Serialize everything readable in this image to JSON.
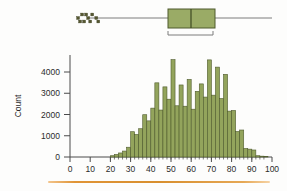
{
  "figure": {
    "background_color": "#fdfdfc",
    "bar_fill_color": "#93a45c",
    "bar_edge_color": "#4e5a2c",
    "axis_color": "#4a4a4a",
    "rule_color": "#e8a councils"
  },
  "boxplot": {
    "name": "horizontal-boxplot",
    "axis_min": 0,
    "axis_max": 100,
    "whisker_low": 20,
    "q1": 49,
    "median": 61,
    "q3": 72,
    "whisker_high": 100,
    "outliers": [
      4,
      5,
      6,
      7,
      8,
      9,
      10,
      11,
      13,
      14
    ],
    "bracket_from": 49,
    "bracket_to": 71,
    "box_fill_color": "#9aab66",
    "box_edge_color": "#4e5a2c",
    "line_color": "#6f6f6f"
  },
  "chart_data": {
    "type": "bar",
    "title": "",
    "xlabel": "",
    "ylabel": "Count",
    "xlim": [
      0,
      100
    ],
    "ylim": [
      0,
      4800
    ],
    "grid": false,
    "legend": null,
    "bin_width": 2,
    "xticks": [
      0,
      10,
      20,
      30,
      40,
      50,
      60,
      70,
      80,
      90,
      100
    ],
    "xticklabels": [
      "0",
      "10",
      "20",
      "30",
      "40",
      "50",
      "60",
      "70",
      "80",
      "90",
      "100"
    ],
    "yticks": [
      0,
      1000,
      2000,
      3000,
      4000
    ],
    "yticklabels": [
      "0",
      "1000",
      "2000",
      "3000",
      "4000"
    ],
    "categories": [
      "20",
      "22",
      "24",
      "26",
      "28",
      "30",
      "32",
      "34",
      "36",
      "38",
      "40",
      "42",
      "44",
      "46",
      "48",
      "50",
      "52",
      "54",
      "56",
      "58",
      "60",
      "62",
      "64",
      "66",
      "68",
      "70",
      "72",
      "74",
      "76",
      "78",
      "80",
      "82",
      "84",
      "86",
      "88",
      "90",
      "92",
      "94",
      "96"
    ],
    "values": [
      60,
      120,
      190,
      280,
      460,
      1190,
      1060,
      1330,
      1990,
      1700,
      2300,
      3490,
      2210,
      3300,
      2720,
      4580,
      2410,
      3390,
      2390,
      3650,
      2250,
      3090,
      3440,
      2820,
      4570,
      2910,
      4230,
      2750,
      3890,
      2160,
      2190,
      1200,
      1270,
      400,
      370,
      330,
      60,
      40,
      30
    ]
  },
  "bottom_rule": {
    "name": "orange-rule",
    "color": "#e9a44a",
    "from_x": 48,
    "to_x": 270
  }
}
